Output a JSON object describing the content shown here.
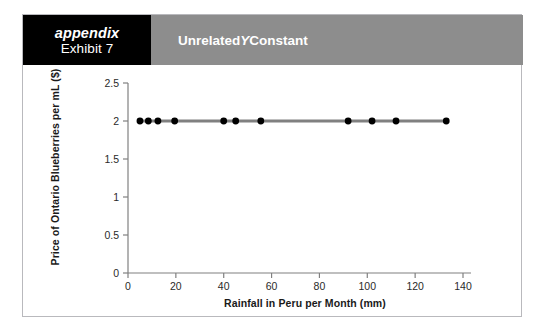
{
  "page": {
    "background": "#ffffff",
    "card_border": "#b9b9bd"
  },
  "header": {
    "appendix_label": "appendix",
    "exhibit_label": "Exhibit 7",
    "title_prefix": "Unrelated ",
    "title_italic": "Y",
    "title_suffix": " Constant",
    "appendix_box_color": "#000000",
    "banner_color": "#8d8d8d",
    "text_color": "#ffffff"
  },
  "chart_data": {
    "type": "line",
    "title": "Unrelated Y Constant",
    "xlabel": "Rainfall in Peru per Month (mm)",
    "ylabel": "Price of Ontario Blueberries per mL ($)",
    "xlim": [
      0,
      140
    ],
    "ylim": [
      0,
      2.5
    ],
    "xticks": [
      0,
      20,
      40,
      60,
      80,
      100,
      120,
      140
    ],
    "xtick_labels": [
      "0",
      "20",
      "40",
      "60",
      "80",
      "100",
      "120",
      "140"
    ],
    "yticks": [
      0,
      0.5,
      1,
      1.5,
      2,
      2.5
    ],
    "ytick_labels": [
      "0",
      "0.5",
      "1",
      "1.5",
      "2",
      "2.5"
    ],
    "grid": false,
    "legend": false,
    "line_color": "#808080",
    "marker_color": "#000000",
    "axis_color": "#808080",
    "marker": "circle",
    "series": [
      {
        "name": "Price of Ontario Blueberries per mL ($)",
        "x": [
          5,
          8.5,
          12.5,
          19.5,
          40,
          45,
          55.5,
          92,
          102,
          112,
          133
        ],
        "y": [
          2,
          2,
          2,
          2,
          2,
          2,
          2,
          2,
          2,
          2,
          2
        ]
      }
    ]
  }
}
